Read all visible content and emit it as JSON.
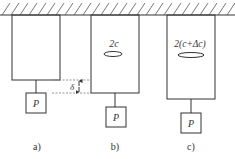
{
  "diagram": {
    "colors": {
      "stroke": "#333333",
      "background": "#ffffff",
      "dashed": "#666666"
    },
    "ceiling": {
      "y": 15,
      "hatch": true
    },
    "panels": [
      {
        "id": "a",
        "label": "a)",
        "block": {
          "x": 12,
          "y": 15,
          "w": 48,
          "h": 65
        },
        "weight": {
          "label": "P",
          "x": 26,
          "y": 93,
          "size": 20
        },
        "crack": null
      },
      {
        "id": "b",
        "label": "b)",
        "block": {
          "x": 91,
          "y": 15,
          "w": 48,
          "h": 78
        },
        "weight": {
          "label": "P",
          "x": 106,
          "y": 107,
          "size": 20
        },
        "crack": {
          "label": "2c",
          "rx": 9,
          "ry": 2.5
        }
      },
      {
        "id": "c",
        "label": "c)",
        "block": {
          "x": 167,
          "y": 15,
          "w": 48,
          "h": 84
        },
        "weight": {
          "label": "P",
          "x": 181,
          "y": 113,
          "size": 20
        },
        "crack": {
          "label": "2(c+Δc)",
          "rx": 13,
          "ry": 2.5
        }
      }
    ],
    "displacement": {
      "label": "δ",
      "y_top": 80,
      "y_bottom": 93
    }
  }
}
